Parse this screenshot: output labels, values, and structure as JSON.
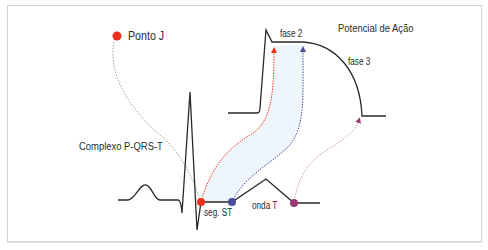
{
  "diagram": {
    "title": "Potencial de Ação",
    "ecg_label": "Complexo P-QRS-T",
    "legend": {
      "marker_label": "Ponto J",
      "marker_color": "#f0301c"
    },
    "phase_labels": {
      "phase2": "fase 2",
      "phase3": "fase 3"
    },
    "ecg_point_labels": {
      "st_segment": "seg. ST",
      "t_wave": "onda T"
    },
    "colors": {
      "line": "#2a2a2a",
      "red": "#f0301c",
      "blue": "#4b4c9a",
      "purple": "#9b3a72",
      "gray_dotted": "#a0a0a0",
      "fill": "#eef5fb",
      "frame": "#d4d4d4"
    },
    "mappings": [
      {
        "from": "seg. ST start (Ponto J)",
        "to": "fase 2 start",
        "color": "red"
      },
      {
        "from": "seg. ST end",
        "to": "fase 2 end",
        "color": "blue"
      },
      {
        "from": "onda T end",
        "to": "fase 3 end",
        "color": "purple"
      }
    ]
  }
}
